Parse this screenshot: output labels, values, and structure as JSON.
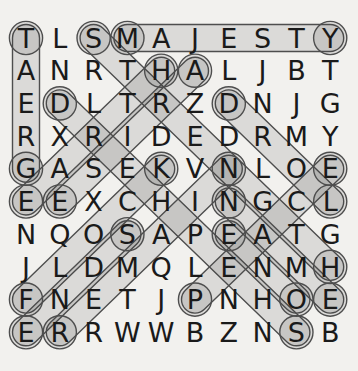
{
  "puzzle": {
    "kind": "word-search-solved",
    "grid_rows": 10,
    "grid_cols": 10,
    "grid": [
      "TLSMAJESTY",
      "ANRTHALJBT",
      "EDLTRZDNJG",
      "RXRIDEDRMY",
      "GASEKVNLOE",
      "EEXCHINGCL",
      "NQOSAPEATG",
      "JLDMQLENMH",
      "FNETJPNHOE",
      "ERRWWBZNSB"
    ],
    "found_words": [
      {
        "word": "MAJESTY",
        "start": {
          "row": 1,
          "col": 4
        },
        "end": {
          "row": 1,
          "col": 10
        },
        "direction": "right"
      },
      {
        "word": "GREAT",
        "start": {
          "row": 5,
          "col": 1
        },
        "end": {
          "row": 1,
          "col": 1
        },
        "direction": "up"
      },
      {
        "word": "STRENGTH",
        "start": {
          "row": 1,
          "col": 3
        },
        "end": {
          "row": 8,
          "col": 10
        },
        "direction": "down-right"
      },
      {
        "word": "EARTH",
        "start": {
          "row": 6,
          "col": 1
        },
        "end": {
          "row": 2,
          "col": 5
        },
        "direction": "up-right"
      },
      {
        "word": "ARISE",
        "start": {
          "row": 2,
          "col": 6
        },
        "end": {
          "row": 6,
          "col": 2
        },
        "direction": "down-left"
      },
      {
        "word": "LORD",
        "start": {
          "row": 6,
          "col": 10
        },
        "end": {
          "row": 3,
          "col": 7
        },
        "direction": "up-left"
      },
      {
        "word": "SHEPHERD",
        "start": {
          "row": 10,
          "col": 9
        },
        "end": {
          "row": 3,
          "col": 2
        },
        "direction": "up-left"
      },
      {
        "word": "FLOCK",
        "start": {
          "row": 9,
          "col": 1
        },
        "end": {
          "row": 5,
          "col": 5
        },
        "direction": "up-right"
      },
      {
        "word": "ENDS",
        "start": {
          "row": 10,
          "col": 1
        },
        "end": {
          "row": 7,
          "col": 4
        },
        "direction": "up-right"
      },
      {
        "word": "REMAIN",
        "start": {
          "row": 10,
          "col": 2
        },
        "end": {
          "row": 5,
          "col": 7
        },
        "direction": "up-right"
      },
      {
        "word": "PEACE",
        "start": {
          "row": 9,
          "col": 6
        },
        "end": {
          "row": 5,
          "col": 10
        },
        "direction": "up-right"
      },
      {
        "word": "NAME",
        "start": {
          "row": 6,
          "col": 7
        },
        "end": {
          "row": 9,
          "col": 10
        },
        "direction": "down-right"
      },
      {
        "word": "ONE",
        "start": {
          "row": 9,
          "col": 9
        },
        "end": {
          "row": 7,
          "col": 7
        },
        "direction": "up-left"
      }
    ],
    "colors": {
      "background": "#f2f1ee",
      "letter": "#1a1a1a",
      "highlight_fill": "#3c3c3c",
      "highlight_stroke": "#4e4e4e"
    }
  }
}
